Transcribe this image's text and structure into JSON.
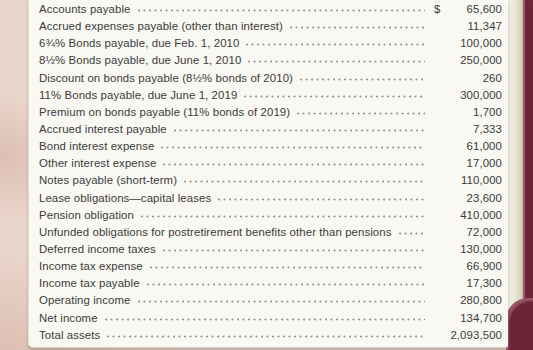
{
  "document": {
    "currency_symbol": "$",
    "line_items": [
      {
        "label": "Accounts payable",
        "currency": "$",
        "amount": "65,600"
      },
      {
        "label": "Accrued expenses payable (other than interest)",
        "currency": "",
        "amount": "11,347"
      },
      {
        "label": "6¾% Bonds payable, due Feb. 1, 2010",
        "currency": "",
        "amount": "100,000"
      },
      {
        "label": "8½% Bonds payable, due June 1, 2010",
        "currency": "",
        "amount": "250,000"
      },
      {
        "label": "Discount on bonds payable (8½% bonds of 2010)",
        "currency": "",
        "amount": "260"
      },
      {
        "label": "11% Bonds payable, due June 1, 2019",
        "currency": "",
        "amount": "300,000"
      },
      {
        "label": "Premium on bonds payable (11% bonds of 2019)",
        "currency": "",
        "amount": "1,700"
      },
      {
        "label": "Accrued interest payable",
        "currency": "",
        "amount": "7,333"
      },
      {
        "label": "Bond interest expense",
        "currency": "",
        "amount": "61,000"
      },
      {
        "label": "Other interest expense",
        "currency": "",
        "amount": "17,000"
      },
      {
        "label": "Notes payable (short-term)",
        "currency": "",
        "amount": "110,000"
      },
      {
        "label": "Lease obligations—capital leases",
        "currency": "",
        "amount": "23,600"
      },
      {
        "label": "Pension obligation",
        "currency": "",
        "amount": "410,000"
      },
      {
        "label": "Unfunded obligations for postretirement benefits other than pensions",
        "currency": "",
        "amount": "72,000"
      },
      {
        "label": "Deferred income taxes",
        "currency": "",
        "amount": "130,000"
      },
      {
        "label": "Income tax expense",
        "currency": "",
        "amount": "66,900"
      },
      {
        "label": "Income tax payable",
        "currency": "",
        "amount": "17,300"
      },
      {
        "label": "Operating income",
        "currency": "",
        "amount": "280,800"
      },
      {
        "label": "Net income",
        "currency": "",
        "amount": "134,700"
      },
      {
        "label": "Total assets",
        "currency": "",
        "amount": "2,093,500"
      }
    ]
  },
  "colors": {
    "page_margin": "#ead5cc",
    "page_margin_dark": "#ddbfb2",
    "panel_bg": "#f9f8f3",
    "book_spine": "#6e2438",
    "text": "#3b3b3b",
    "leader_dots": "#8a8a8a"
  }
}
